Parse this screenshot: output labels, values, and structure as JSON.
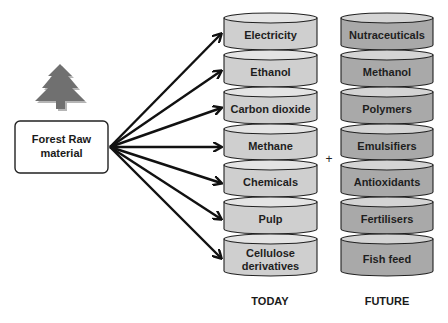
{
  "source": {
    "line1": "Forest Raw",
    "line2": "material",
    "icon": "tree-icon"
  },
  "stacks": {
    "today": {
      "label": "TODAY",
      "fill": "#cfcfcf",
      "items": [
        {
          "line1": "Electricity",
          "line2": ""
        },
        {
          "line1": "Ethanol",
          "line2": ""
        },
        {
          "line1": "Carbon dioxide",
          "line2": ""
        },
        {
          "line1": "Methane",
          "line2": ""
        },
        {
          "line1": "Chemicals",
          "line2": ""
        },
        {
          "line1": "Pulp",
          "line2": ""
        },
        {
          "line1": "Cellulose",
          "line2": "derivatives"
        }
      ]
    },
    "future": {
      "label": "FUTURE",
      "fill": "#a9a9a9",
      "items": [
        {
          "line1": "Nutraceuticals"
        },
        {
          "line1": "Methanol"
        },
        {
          "line1": "Polymers"
        },
        {
          "line1": "Emulsifiers"
        },
        {
          "line1": "Antioxidants"
        },
        {
          "line1": "Fertilisers"
        },
        {
          "line1": "Fish feed"
        }
      ]
    }
  },
  "connector": "+"
}
